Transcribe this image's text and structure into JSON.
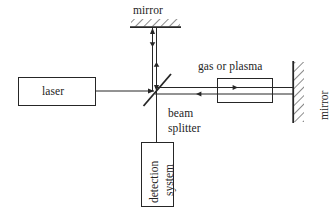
{
  "figure": {
    "type": "optical-setup-diagram",
    "title": "",
    "background_color": "#ffffff",
    "line_color": "#262626",
    "text_color": "#242424"
  },
  "labels": {
    "top_mirror": "mirror",
    "right_mirror": "mirror",
    "laser": "laser",
    "gas_cell": "gas or plasma",
    "beam_splitter_line1": "beam",
    "beam_splitter_line2": "splitter",
    "detection_line1": "detection",
    "detection_line2": "system"
  },
  "components": [
    {
      "name": "laser-box",
      "label": "laser",
      "shape": "rectangle"
    },
    {
      "name": "top-mirror",
      "label": "mirror",
      "shape": "hatched-line-horizontal"
    },
    {
      "name": "beam-splitter",
      "label": "beam splitter",
      "shape": "diagonal-line"
    },
    {
      "name": "gas-cell-box",
      "label": "gas or plasma",
      "shape": "rectangle"
    },
    {
      "name": "right-mirror",
      "label": "mirror",
      "shape": "hatched-line-vertical"
    },
    {
      "name": "detection-system-box",
      "label": "detection system",
      "shape": "rectangle"
    }
  ],
  "beams": [
    {
      "name": "laser-to-splitter",
      "direction": "right"
    },
    {
      "name": "splitter-to-top-mirror",
      "direction": "up-and-down"
    },
    {
      "name": "splitter-to-gas-cell",
      "direction": "right-and-left"
    },
    {
      "name": "splitter-to-detection",
      "direction": "down"
    }
  ]
}
